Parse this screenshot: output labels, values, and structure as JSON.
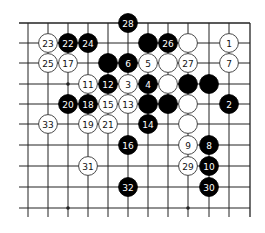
{
  "board": {
    "description": "Go board corner fragment (top-right), 12 columns x 10 rows visible",
    "colors": {
      "background": "#ffffff",
      "line": "#222222",
      "black_stone": "#000000",
      "white_stone": "#ffffff",
      "stone_border": "#333333",
      "black_text": "#ffffff",
      "white_text": "#111111"
    },
    "columns_x": [
      28,
      48,
      68,
      88,
      108,
      128,
      148,
      168,
      188,
      209,
      229,
      250
    ],
    "rows_y": [
      23,
      43,
      63,
      84,
      104,
      124,
      145,
      166,
      187,
      208
    ],
    "edges": {
      "top": true,
      "right": true,
      "left": false,
      "bottom": false
    },
    "star_points": [
      [
        2,
        3
      ],
      [
        8,
        3
      ],
      [
        2,
        9
      ],
      [
        8,
        9
      ]
    ],
    "stones": [
      {
        "col": 5,
        "row": 0,
        "color": "black",
        "label": "28"
      },
      {
        "col": 1,
        "row": 1,
        "color": "white",
        "label": "23"
      },
      {
        "col": 2,
        "row": 1,
        "color": "black",
        "label": "22"
      },
      {
        "col": 3,
        "row": 1,
        "color": "black",
        "label": "24"
      },
      {
        "col": 6,
        "row": 1,
        "color": "black",
        "label": ""
      },
      {
        "col": 7,
        "row": 1,
        "color": "black",
        "label": "26"
      },
      {
        "col": 8,
        "row": 1,
        "color": "white",
        "label": ""
      },
      {
        "col": 10,
        "row": 1,
        "color": "white",
        "label": "1"
      },
      {
        "col": 1,
        "row": 2,
        "color": "white",
        "label": "25"
      },
      {
        "col": 2,
        "row": 2,
        "color": "white",
        "label": "17"
      },
      {
        "col": 4,
        "row": 2,
        "color": "black",
        "label": ""
      },
      {
        "col": 5,
        "row": 2,
        "color": "black",
        "label": "6"
      },
      {
        "col": 6,
        "row": 2,
        "color": "white",
        "label": "5"
      },
      {
        "col": 7,
        "row": 2,
        "color": "white",
        "label": ""
      },
      {
        "col": 8,
        "row": 2,
        "color": "white",
        "label": "27"
      },
      {
        "col": 10,
        "row": 2,
        "color": "white",
        "label": "7"
      },
      {
        "col": 3,
        "row": 3,
        "color": "white",
        "label": "11"
      },
      {
        "col": 4,
        "row": 3,
        "color": "black",
        "label": "12"
      },
      {
        "col": 5,
        "row": 3,
        "color": "white",
        "label": "3"
      },
      {
        "col": 6,
        "row": 3,
        "color": "black",
        "label": "4"
      },
      {
        "col": 7,
        "row": 3,
        "color": "white",
        "label": ""
      },
      {
        "col": 8,
        "row": 3,
        "color": "black",
        "label": ""
      },
      {
        "col": 9,
        "row": 3,
        "color": "black",
        "label": ""
      },
      {
        "col": 2,
        "row": 4,
        "color": "black",
        "label": "20"
      },
      {
        "col": 3,
        "row": 4,
        "color": "black",
        "label": "18"
      },
      {
        "col": 4,
        "row": 4,
        "color": "white",
        "label": "15"
      },
      {
        "col": 5,
        "row": 4,
        "color": "white",
        "label": "13"
      },
      {
        "col": 6,
        "row": 4,
        "color": "black",
        "label": ""
      },
      {
        "col": 7,
        "row": 4,
        "color": "black",
        "label": ""
      },
      {
        "col": 8,
        "row": 4,
        "color": "white",
        "label": ""
      },
      {
        "col": 10,
        "row": 4,
        "color": "black",
        "label": "2"
      },
      {
        "col": 1,
        "row": 5,
        "color": "white",
        "label": "33"
      },
      {
        "col": 3,
        "row": 5,
        "color": "white",
        "label": "19"
      },
      {
        "col": 4,
        "row": 5,
        "color": "white",
        "label": "21"
      },
      {
        "col": 6,
        "row": 5,
        "color": "black",
        "label": "14"
      },
      {
        "col": 8,
        "row": 5,
        "color": "white",
        "label": ""
      },
      {
        "col": 5,
        "row": 6,
        "color": "black",
        "label": "16"
      },
      {
        "col": 8,
        "row": 6,
        "color": "white",
        "label": "9"
      },
      {
        "col": 9,
        "row": 6,
        "color": "black",
        "label": "8"
      },
      {
        "col": 3,
        "row": 7,
        "color": "white",
        "label": "31"
      },
      {
        "col": 8,
        "row": 7,
        "color": "white",
        "label": "29"
      },
      {
        "col": 9,
        "row": 7,
        "color": "black",
        "label": "10"
      },
      {
        "col": 5,
        "row": 8,
        "color": "black",
        "label": "32"
      },
      {
        "col": 9,
        "row": 8,
        "color": "black",
        "label": "30"
      }
    ]
  }
}
